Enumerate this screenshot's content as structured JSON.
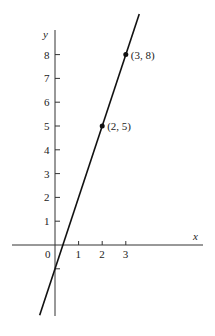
{
  "chart_data": {
    "type": "line",
    "title": "",
    "xlabel": "x",
    "ylabel": "y",
    "x_ticks": [
      "1",
      "2",
      "3"
    ],
    "y_ticks": [
      "1",
      "2",
      "3",
      "4",
      "5",
      "6",
      "7",
      "8"
    ],
    "origin_label": "0",
    "xlim": [
      -1.8,
      6.3
    ],
    "ylim": [
      -3,
      9.7
    ],
    "grid": false,
    "series": [
      {
        "name": "y = 3x - 1",
        "slope": 3,
        "intercept": -1,
        "x": [
          -0.65,
          3.57
        ],
        "y": [
          -2.95,
          9.71
        ]
      }
    ],
    "points": [
      {
        "x": 2,
        "y": 5,
        "label": "(2, 5)"
      },
      {
        "x": 3,
        "y": 8,
        "label": "(3, 8)"
      }
    ]
  },
  "colors": {
    "ink": "#222222",
    "background": "#ffffff"
  }
}
